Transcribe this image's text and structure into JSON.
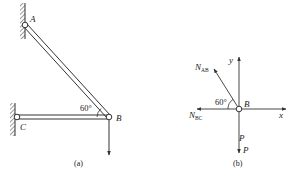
{
  "figure_a": {
    "caption": "(a)",
    "points": {
      "A": {
        "label": "A"
      },
      "B": {
        "label": "B"
      },
      "C": {
        "label": "C"
      }
    },
    "angle_label": "60°",
    "members": [
      "AB",
      "BC"
    ],
    "load": "downward load at B"
  },
  "figure_b": {
    "caption": "(b)",
    "point_label": "B",
    "axes": {
      "x": "x",
      "y": "y"
    },
    "forces": {
      "n_ab": {
        "base": "N",
        "sub": "AB"
      },
      "n_bc": {
        "base": "N",
        "sub": "BC"
      },
      "p_upper": "P",
      "p_lower": "P"
    },
    "angle_label": "60°"
  },
  "colors": {
    "line": "#333333",
    "hatch": "#555555",
    "background": "#ffffff"
  }
}
